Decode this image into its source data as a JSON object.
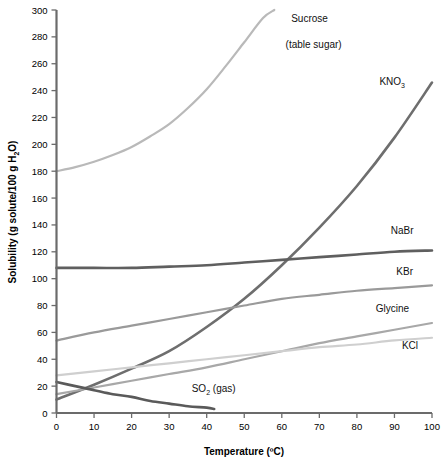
{
  "chart_data": {
    "type": "line",
    "title": "",
    "xlabel": "Temperature (ºC)",
    "ylabel": "Solubility (g solute/100 g H2O)",
    "ylabel_parts": {
      "pre": "Solubility (g solute/100 g H",
      "sub": "2",
      "post": "O)"
    },
    "xlim": [
      0,
      100
    ],
    "ylim": [
      0,
      300
    ],
    "xticks": [
      0,
      10,
      20,
      30,
      40,
      50,
      60,
      70,
      80,
      90,
      100
    ],
    "yticks": [
      0,
      20,
      40,
      60,
      80,
      100,
      120,
      140,
      160,
      180,
      200,
      220,
      240,
      260,
      280,
      300
    ],
    "grid": false,
    "legend_position": "inline-curve-labels",
    "series": [
      {
        "name": "Sucrose (table sugar)",
        "label_line1": "Sucrose",
        "label_line2": "(table sugar)",
        "color": "#b9b9b9",
        "width": 2.2,
        "x": [
          0,
          5,
          10,
          15,
          20,
          25,
          30,
          35,
          40,
          45,
          50,
          55,
          58
        ],
        "values": [
          180,
          183,
          187,
          192,
          198,
          206,
          215,
          227,
          241,
          258,
          276,
          294,
          300
        ]
      },
      {
        "name": "KNO3",
        "label_line1": "KNO",
        "label_sub": "3",
        "color": "#6e6e6e",
        "width": 2.6,
        "x": [
          0,
          10,
          20,
          30,
          40,
          50,
          60,
          70,
          80,
          90,
          100
        ],
        "values": [
          10,
          21,
          33,
          46,
          64,
          85,
          110,
          138,
          169,
          205,
          246
        ]
      },
      {
        "name": "NaBr",
        "label_line1": "NaBr",
        "color": "#5f5f5f",
        "width": 2.6,
        "x": [
          0,
          10,
          20,
          30,
          40,
          50,
          60,
          70,
          80,
          90,
          100
        ],
        "values": [
          108,
          108,
          108,
          109,
          110,
          112,
          114,
          116,
          118,
          120,
          121
        ]
      },
      {
        "name": "KBr",
        "label_line1": "KBr",
        "color": "#9a9a9a",
        "width": 2.2,
        "x": [
          0,
          10,
          20,
          30,
          40,
          50,
          60,
          70,
          80,
          90,
          100
        ],
        "values": [
          54,
          60,
          65,
          70,
          75,
          80,
          85,
          88,
          91,
          93,
          95
        ]
      },
      {
        "name": "Glycine",
        "label_line1": "Glycine",
        "color": "#a8a8a8",
        "width": 2.2,
        "x": [
          0,
          10,
          20,
          30,
          40,
          50,
          60,
          70,
          80,
          90,
          100
        ],
        "values": [
          14,
          19,
          24,
          29,
          34,
          40,
          46,
          52,
          57,
          62,
          67
        ]
      },
      {
        "name": "KCl",
        "label_line1": "KCl",
        "color": "#cfcfcf",
        "width": 2.2,
        "x": [
          0,
          10,
          20,
          30,
          40,
          50,
          60,
          70,
          80,
          90,
          100
        ],
        "values": [
          28,
          31,
          34,
          37,
          40,
          43,
          46,
          49,
          51,
          54,
          56
        ]
      },
      {
        "name": "SO2 (gas)",
        "label_line1": "SO",
        "label_sub": "2",
        "label_line2": " (gas)",
        "color": "#5a5a5a",
        "width": 2.6,
        "x": [
          0,
          5,
          10,
          15,
          20,
          25,
          30,
          35,
          40,
          42
        ],
        "values": [
          23,
          20,
          17,
          14,
          12,
          9,
          7,
          5,
          4,
          3
        ]
      }
    ],
    "annotations": [
      {
        "text": "Sucrose",
        "series": "Sucrose (table sugar)"
      },
      {
        "text": "(table sugar)",
        "series": "Sucrose (table sugar)"
      },
      {
        "text": "KNO3",
        "series": "KNO3"
      },
      {
        "text": "NaBr",
        "series": "NaBr"
      },
      {
        "text": "KBr",
        "series": "KBr"
      },
      {
        "text": "Glycine",
        "series": "Glycine"
      },
      {
        "text": "KCl",
        "series": "KCl"
      },
      {
        "text": "SO2 (gas)",
        "series": "SO2 (gas)"
      }
    ]
  },
  "axis": {
    "x_title": "Temperature (ºC)",
    "y_title_pre": "Solubility (g solute/100 g H",
    "y_title_sub": "2",
    "y_title_post": "O)"
  },
  "labels": {
    "sucrose_1": "Sucrose",
    "sucrose_2": "(table sugar)",
    "kno3_main": "KNO",
    "kno3_sub": "3",
    "nabr": "NaBr",
    "kbr": "KBr",
    "glycine": "Glycine",
    "kcl": "KCl",
    "so2_main": "SO",
    "so2_sub": "2",
    "so2_post": " (gas)"
  },
  "colors": {
    "axis": "#6b6b6b",
    "text": "#000000",
    "background": "#ffffff"
  }
}
